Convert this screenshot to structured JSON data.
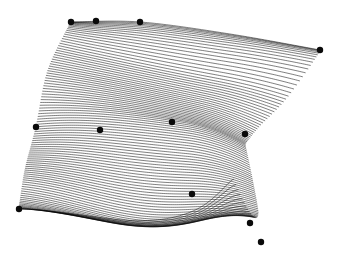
{
  "figure": {
    "kind": "parametric-surface-isocurve-plot",
    "background_color": "#ffffff",
    "curve_color": "#000000",
    "control_point_color": "#0a0a0a",
    "width": 341,
    "height": 259
  },
  "chart_data": {
    "type": "line",
    "title": "",
    "xlabel": "",
    "ylabel": "",
    "xlim": [
      0,
      341
    ],
    "ylim": [
      259,
      0
    ],
    "grid": false,
    "legend": null,
    "isocurve_count": 96,
    "isocurve_stroke_width": 0.55,
    "control_point_radius": 3.2,
    "control_points": [
      {
        "id": "cp-0",
        "x": 71,
        "y": 22
      },
      {
        "id": "cp-1",
        "x": 96,
        "y": 21
      },
      {
        "id": "cp-2",
        "x": 140,
        "y": 22
      },
      {
        "id": "cp-3",
        "x": 320,
        "y": 50
      },
      {
        "id": "cp-4",
        "x": 36,
        "y": 127
      },
      {
        "id": "cp-5",
        "x": 100,
        "y": 130
      },
      {
        "id": "cp-6",
        "x": 172,
        "y": 122
      },
      {
        "id": "cp-7",
        "x": 245,
        "y": 134
      },
      {
        "id": "cp-8",
        "x": 19,
        "y": 209
      },
      {
        "id": "cp-9",
        "x": 192,
        "y": 194
      },
      {
        "id": "cp-10",
        "x": 250,
        "y": 223
      },
      {
        "id": "cp-11",
        "x": 261,
        "y": 242
      }
    ],
    "boundary_left": [
      [
        71,
        22
      ],
      [
        48,
        70
      ],
      [
        36,
        127
      ],
      [
        25,
        170
      ],
      [
        19,
        209
      ]
    ],
    "boundary_top": [
      [
        71,
        22
      ],
      [
        140,
        22
      ],
      [
        230,
        34
      ],
      [
        320,
        50
      ]
    ],
    "boundary_bottom": [
      [
        19,
        209
      ],
      [
        110,
        205
      ],
      [
        192,
        194
      ],
      [
        232,
        176
      ]
    ],
    "boundary_right_upper": [
      [
        320,
        50
      ],
      [
        288,
        92
      ],
      [
        258,
        120
      ],
      [
        245,
        134
      ]
    ],
    "boundary_right_notch": [
      [
        245,
        134
      ],
      [
        252,
        168
      ],
      [
        258,
        205
      ],
      [
        261,
        242
      ]
    ],
    "fold_band": {
      "start": [
        42,
        178
      ],
      "peak": [
        120,
        158
      ],
      "end": [
        235,
        180
      ],
      "darkness": "high"
    }
  }
}
